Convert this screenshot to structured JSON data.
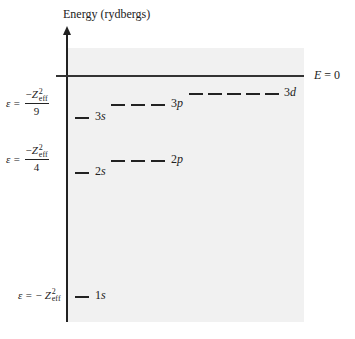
{
  "diagram": {
    "axis_title": "Energy (rydbergs)",
    "zero_label": {
      "symbol": "E",
      "rest": " = 0"
    },
    "colors": {
      "shade": "#f1f1f1",
      "lines": "#222222",
      "background": "#ffffff"
    },
    "formulas": [
      {
        "id": "n3",
        "prefix": "ε =",
        "numerator_sign": "−",
        "z": "Z",
        "sup": "2",
        "sub": "eff",
        "denominator": "9"
      },
      {
        "id": "n2",
        "prefix": "ε =",
        "numerator_sign": "−",
        "z": "Z",
        "sup": "2",
        "sub": "eff",
        "denominator": "4"
      },
      {
        "id": "n1",
        "prefix": "ε = −",
        "z": "Z",
        "sup": "2",
        "sub": "eff"
      }
    ],
    "levels": [
      {
        "n": "1",
        "l": "s",
        "degeneracy": 1
      },
      {
        "n": "2",
        "l": "s",
        "degeneracy": 1
      },
      {
        "n": "2",
        "l": "p",
        "degeneracy": 3
      },
      {
        "n": "3",
        "l": "s",
        "degeneracy": 1
      },
      {
        "n": "3",
        "l": "p",
        "degeneracy": 3
      },
      {
        "n": "3",
        "l": "d",
        "degeneracy": 5
      }
    ]
  }
}
